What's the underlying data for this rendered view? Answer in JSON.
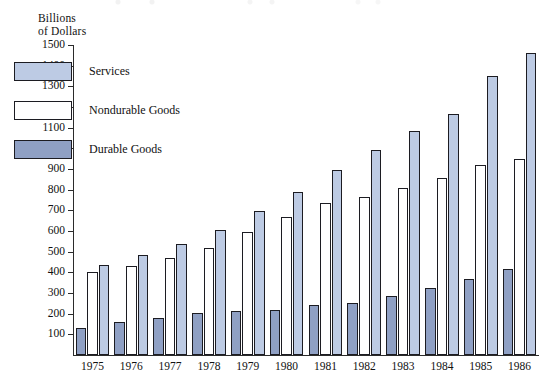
{
  "chart_data": {
    "type": "bar",
    "title": "",
    "subtitle": "",
    "xlabel": "",
    "ylabel": "Billions\nof Dollars",
    "ylabel_lines": [
      "Billions",
      "of Dollars"
    ],
    "categories": [
      "1975",
      "1976",
      "1977",
      "1978",
      "1979",
      "1980",
      "1981",
      "1982",
      "1983",
      "1984",
      "1985",
      "1986"
    ],
    "ylim": [
      0,
      1500
    ],
    "ytick_values": [
      100,
      200,
      300,
      400,
      500,
      600,
      700,
      800,
      900,
      1000,
      1100,
      1200,
      1300,
      1400,
      1500
    ],
    "ytick_labels": [
      "100",
      "200",
      "300",
      "400",
      "500",
      "600",
      "700",
      "800",
      "900",
      "1000",
      "1100",
      "1200",
      "1300",
      "1400",
      "1500"
    ],
    "grid": false,
    "legend_position": "upper-left-inside",
    "series": [
      {
        "name": "Durable Goods",
        "color": "#8fa0c4",
        "values": [
          133,
          158,
          180,
          203,
          215,
          219,
          240,
          250,
          285,
          322,
          370,
          418
        ]
      },
      {
        "name": "Nondurable Goods",
        "color": "#ffffff",
        "values": [
          403,
          432,
          470,
          518,
          597,
          668,
          736,
          766,
          808,
          858,
          918,
          948
        ]
      },
      {
        "name": "Services",
        "color": "#bdcbe4",
        "values": [
          434,
          483,
          537,
          607,
          697,
          789,
          895,
          993,
          1083,
          1168,
          1348,
          1462
        ]
      }
    ],
    "legend_order": [
      "Services",
      "Nondurable Goods",
      "Durable Goods"
    ],
    "series_draw_order": [
      "Durable Goods",
      "Nondurable Goods",
      "Services"
    ]
  },
  "colors": {
    "services": "#bdcbe4",
    "nondurable": "#ffffff",
    "durable": "#8fa0c4",
    "outline": "#1c1c22",
    "axis": "#2b2b2b",
    "background": "#ffffff"
  }
}
